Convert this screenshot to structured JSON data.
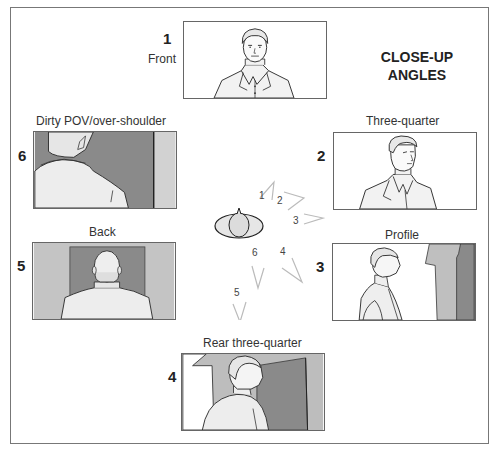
{
  "title": {
    "line1": "CLOSE-UP",
    "line2": "ANGLES"
  },
  "panels": [
    {
      "number": "1",
      "label": "Front",
      "icon": "front-view-figure"
    },
    {
      "number": "2",
      "label": "Three-quarter",
      "icon": "three-quarter-view-figure"
    },
    {
      "number": "3",
      "label": "Profile",
      "icon": "profile-view-figure"
    },
    {
      "number": "4",
      "label": "Rear three-quarter",
      "icon": "rear-three-quarter-view-figure"
    },
    {
      "number": "5",
      "label": "Back",
      "icon": "back-view-figure"
    },
    {
      "number": "6",
      "label": "Dirty POV/over-shoulder",
      "icon": "over-shoulder-view-figure"
    }
  ],
  "diagram": {
    "subject_icon": "top-down-head-icon",
    "camera_positions": [
      "1",
      "2",
      "3",
      "4",
      "5",
      "6"
    ]
  },
  "colors": {
    "frame_border": "#777777",
    "panel_border": "#666666",
    "dark_fill": "#8a8a8a",
    "mid_fill": "#b5b5b5",
    "light_fill": "#d9d9d9",
    "arrow": "#bbbbbb"
  }
}
